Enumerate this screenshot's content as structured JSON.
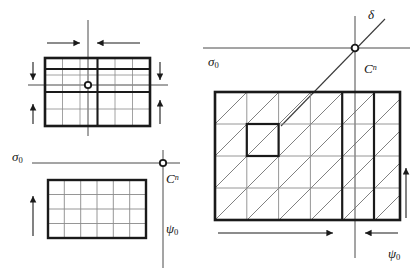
{
  "figure": {
    "background_color": "#ffffff",
    "ink_color": "#1a1a1a",
    "hatch_color": "#555555",
    "thin_color": "#777777"
  },
  "labels": {
    "sigma_top_left": "σ",
    "sigma_top_left_sub": "0",
    "cn_top_left": "C",
    "cn_top_left_sup": "n",
    "psi_top_left": "ψ",
    "psi_top_left_sub": "0",
    "sigma_right": "σ",
    "sigma_right_sub": "0",
    "delta_right": "δ",
    "cn_right": "C",
    "cn_right_sup": "n",
    "psi_right": "ψ",
    "psi_right_sub": "0"
  },
  "panels": {
    "top_left": {
      "name": "refined-cell-block",
      "rect": {
        "x": 45,
        "y": 58,
        "w": 105,
        "h": 68
      },
      "cols": 6,
      "rows": 4,
      "thick_vertical_indices": [
        2,
        3
      ],
      "thick_horizontal_indices": [
        1,
        2
      ],
      "center_marker": {
        "x": 88,
        "y": 85,
        "r": 3
      },
      "axis_horizontal": {
        "x1": 28,
        "y1": 85,
        "x2": 168,
        "y2": 85
      },
      "axis_vertical": {
        "x1": 88,
        "y1": 20,
        "x2": 88,
        "y2": 136
      },
      "arrows": [
        {
          "name": "arrow-top-left-inward",
          "x1": 47,
          "y1": 43,
          "x2": 80,
          "y2": 43,
          "dir": "right"
        },
        {
          "name": "arrow-top-right-inward",
          "x1": 140,
          "y1": 43,
          "x2": 96,
          "y2": 43,
          "dir": "left"
        },
        {
          "name": "arrow-left-upper-down",
          "x1": 33,
          "y1": 62,
          "x2": 33,
          "y2": 82,
          "dir": "down"
        },
        {
          "name": "arrow-left-lower-up",
          "x1": 33,
          "y1": 124,
          "x2": 33,
          "y2": 104,
          "dir": "up"
        },
        {
          "name": "arrow-right-upper-down",
          "x1": 160,
          "y1": 62,
          "x2": 160,
          "y2": 82,
          "dir": "down"
        },
        {
          "name": "arrow-right-lower-up",
          "x1": 160,
          "y1": 124,
          "x2": 160,
          "y2": 100,
          "dir": "up"
        }
      ]
    },
    "bottom_left": {
      "name": "coarse-cell-block",
      "rect": {
        "x": 48,
        "y": 180,
        "w": 98,
        "h": 58
      },
      "cols": 6,
      "rows": 4,
      "axis_horizontal": {
        "x1": 32,
        "y1": 163,
        "x2": 180,
        "y2": 163
      },
      "axis_vertical": {
        "x1": 163,
        "y1": 150,
        "x2": 163,
        "y2": 268
      },
      "origin_marker": {
        "x": 163,
        "y": 163,
        "r": 3
      },
      "arrows": [
        {
          "name": "arrow-bottom-left-up",
          "x1": 33,
          "y1": 236,
          "x2": 33,
          "y2": 196,
          "dir": "up"
        }
      ]
    },
    "right": {
      "name": "hatched-cell-block",
      "rect": {
        "x": 215,
        "y": 92,
        "w": 185,
        "h": 128
      },
      "cols": 6,
      "rows": 4,
      "hatch": "diagonal-up-right",
      "thick_vertical_indices": [
        4,
        5
      ],
      "highlight_cell": {
        "col": 1,
        "row": 1
      },
      "axis_horizontal": {
        "x1": 203,
        "y1": 48,
        "x2": 410,
        "y2": 48
      },
      "axis_vertical": {
        "x1": 355,
        "y1": 16,
        "x2": 355,
        "y2": 258
      },
      "origin_marker": {
        "x": 355,
        "y": 48,
        "r": 3
      },
      "delta_line": {
        "x1": 284,
        "y1": 123,
        "x2": 383,
        "y2": 20
      },
      "arrows": [
        {
          "name": "arrow-bottom-wide-right",
          "x1": 218,
          "y1": 233,
          "x2": 333,
          "y2": 233,
          "dir": "right"
        },
        {
          "name": "arrow-bottom-narrow-left",
          "x1": 398,
          "y1": 233,
          "x2": 364,
          "y2": 233,
          "dir": "left"
        },
        {
          "name": "arrow-right-side-up",
          "x1": 406,
          "y1": 218,
          "x2": 406,
          "y2": 168,
          "dir": "up"
        }
      ]
    }
  }
}
